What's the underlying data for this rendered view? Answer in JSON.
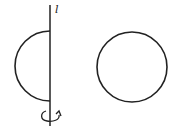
{
  "diagram": {
    "axis_label": "l",
    "shapes": [
      {
        "name": "semicircle",
        "description": "half-disk attached to axis l, left side"
      },
      {
        "name": "circle",
        "description": "full circle to the right"
      }
    ],
    "rotation_indicator": "rotation-arrow around axis",
    "colors": {
      "stroke": "#222222",
      "background": "#ffffff"
    }
  }
}
